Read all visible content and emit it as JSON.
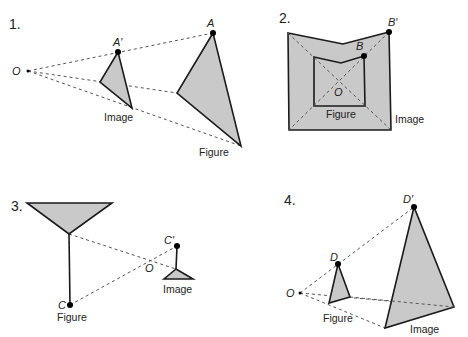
{
  "colors": {
    "shape_fill": "#c9c9c9",
    "outline": "#1a1a1a",
    "dashed_ray": "#555555",
    "point": "#000000"
  },
  "panels": [
    {
      "number": "1.",
      "center_label": "O",
      "point_label": "A",
      "image_point_label": "A′",
      "figure_label": "Figure",
      "image_label": "Image",
      "description": "Reduction: image triangle lies between center O and figure triangle"
    },
    {
      "number": "2.",
      "center_label": "O",
      "point_label": "B",
      "image_point_label": "B′",
      "figure_label": "Figure",
      "image_label": "Image",
      "description": "Enlargement: notched pentagon figure inside larger image, center O inside"
    },
    {
      "number": "3.",
      "center_label": "O",
      "point_label": "C",
      "image_point_label": "C′",
      "figure_label": "Figure",
      "image_label": "Image",
      "description": "Negative scale factor: image is inverted, smaller, on opposite side of O"
    },
    {
      "number": "4.",
      "center_label": "O",
      "point_label": "D",
      "image_point_label": "D′",
      "figure_label": "Figure",
      "image_label": "Image",
      "description": "Enlargement: figure triangle near O, larger image triangle farther away"
    }
  ]
}
